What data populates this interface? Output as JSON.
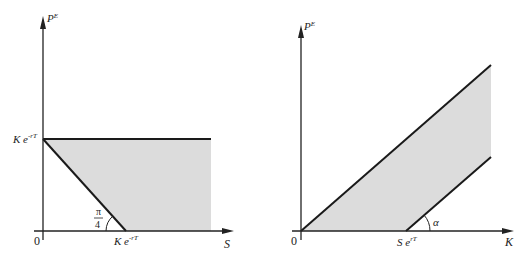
{
  "colors": {
    "shade": "#dcdcdc",
    "line": "#1a1a1a",
    "axis": "#222222"
  },
  "left_panel": {
    "y_axis_label": "P",
    "y_axis_label_sup": "E",
    "x_axis_label": "S",
    "origin_label": "0",
    "y_tick_label_base": "K e",
    "y_tick_label_sup": "-rT",
    "x_tick_label_base": "K e",
    "x_tick_label_sup": "-rT",
    "angle_label_num": "π",
    "angle_label_den": "4"
  },
  "right_panel": {
    "y_axis_label": "P",
    "y_axis_label_sup": "E",
    "x_axis_label": "K",
    "origin_label": "0",
    "x_tick_label_base": "S e",
    "x_tick_label_sup": "rT",
    "angle_label": "α"
  }
}
